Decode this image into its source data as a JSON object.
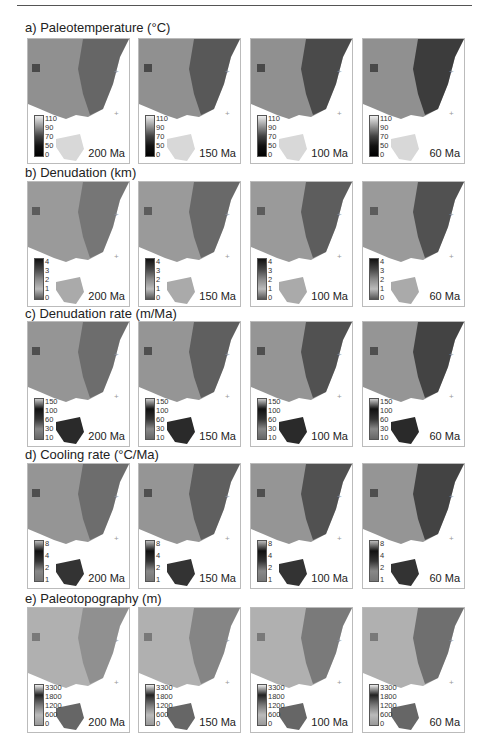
{
  "figure": {
    "rows": [
      {
        "label": "a) Paleotemperature (°C)",
        "legend_ticks": [
          "110",
          "90",
          "70",
          "50",
          "0"
        ],
        "legend_gradient": "linear-gradient(to bottom,#eee,#999,#444,#111,#000)",
        "land": "#909090",
        "dark": "#1a1a1a",
        "tas": "#d8d8d8"
      },
      {
        "label": "b) Denudation (km)",
        "legend_ticks": [
          "4",
          "3",
          "2",
          "1",
          "0"
        ],
        "legend_gradient": "linear-gradient(to bottom,#111,#444,#888,#bbb,#555)",
        "land": "#9a9a9a",
        "dark": "#333",
        "tas": "#aaa"
      },
      {
        "label": "c) Denudation rate (m/Ma)",
        "legend_ticks": [
          "150",
          "100",
          "60",
          "30",
          "10"
        ],
        "legend_gradient": "linear-gradient(to bottom,#ccc,#111,#333,#888,#666)",
        "land": "#959595",
        "dark": "#222",
        "tas": "#2a2a2a"
      },
      {
        "label": "d) Cooling rate (°C/Ma)",
        "legend_ticks": [
          "8",
          "4",
          "2",
          "1"
        ],
        "legend_gradient": "linear-gradient(to bottom,#bbb,#111,#333,#888,#777)",
        "land": "#959595",
        "dark": "#222",
        "tas": "#333"
      },
      {
        "label": "e) Paleotopography (m)",
        "legend_ticks": [
          "3300",
          "1800",
          "1200",
          "600",
          "0"
        ],
        "legend_gradient": "linear-gradient(to bottom,#eee,#222,#777,#bbb,#999)",
        "land": "#b0b0b0",
        "dark": "#555",
        "tas": "#666"
      }
    ],
    "ages": [
      "200 Ma",
      "150 Ma",
      "100 Ma",
      "60 Ma"
    ]
  }
}
